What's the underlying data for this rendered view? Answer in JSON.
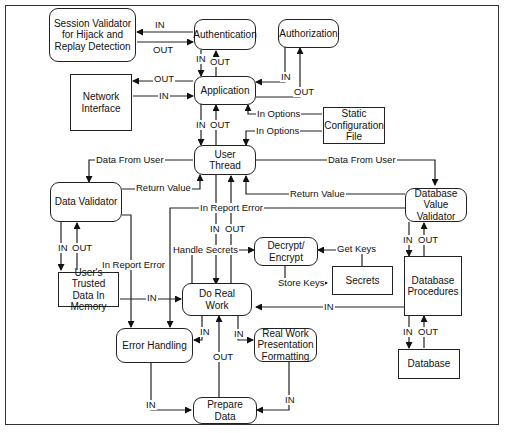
{
  "diagram": {
    "nodes": {
      "session_validator": "Session Validator for Hijack and Replay Detection",
      "authentication": "Authentication",
      "authorization": "Authorization",
      "network_interface": "Network Interface",
      "application": "Application",
      "static_config": "Static Configuration File",
      "user_thread": "User Thread",
      "data_validator": "Data Validator",
      "db_value_validator": "Database Value Validator",
      "decrypt_encrypt": "Decrypt/ Encrypt",
      "secrets": "Secrets",
      "trusted_data": "User's Trusted Data In Memory",
      "do_real_work": "Do Real Work",
      "db_procedures": "Database Procedures",
      "error_handling": "Error Handling",
      "presentation": "Real Work Presentation Formatting",
      "database": "Database",
      "prepare_data": "Prepare Data"
    },
    "edge_labels": {
      "sv_in": "IN",
      "sv_out": "OUT",
      "auth_in": "IN",
      "auth_out": "OUT",
      "authz_in": "IN",
      "authz_out": "OUT",
      "net_out": "OUT",
      "net_in": "IN",
      "opt1": "In Options",
      "opt2": "In Options",
      "app_in": "IN",
      "app_out": "OUT",
      "data_from_user_left": "Data From User",
      "data_from_user_right": "Data From User",
      "return_value_left": "Return Value",
      "return_value_right": "Return Value",
      "report_error_top": "In Report Error",
      "ut_in": "IN",
      "ut_out": "OUT",
      "dv_in": "IN",
      "dv_out": "OUT",
      "report_error_left": "In Report Error",
      "handle_secrets": "Handle Secrets",
      "get_keys": "Get Keys",
      "store_keys": "Store Keys",
      "dbv_in": "IN",
      "dbv_out": "OUT",
      "trusted_in": "IN",
      "dbp_in": "IN",
      "drw_err_in": "IN",
      "drw_pres_in": "IN",
      "prep_out": "OUT",
      "db_in": "IN",
      "db_out": "OUT",
      "err_prep_in": "IN",
      "pres_prep_in": "IN"
    }
  }
}
